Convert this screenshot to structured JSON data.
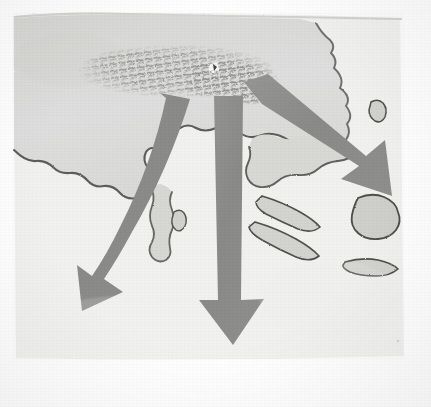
{
  "image": {
    "kind": "scanned-map-figure",
    "medium": "halftone grayscale scan of a printed book page",
    "subject": "Migration / invasion route map of the southern Balkan peninsula and Aegean Sea",
    "orientation": "north-up",
    "visible_text": [],
    "title": "",
    "caption": "",
    "legend": ""
  },
  "colors": {
    "paper": "#fbfbf9",
    "sea": "#f1f1ef",
    "land_fill": "#dcdcda",
    "land_fill_dark": "#cfcfcc",
    "coastline_stroke": "#4c4c4a",
    "coastline_soft": "#9a9a96",
    "arrow_fill": "#8b8b89",
    "arrow_fill_light": "#9b9b99",
    "mountain_texture": "#8e8e8a",
    "scan_edge": "#e6e6e3",
    "marker_white": "#fdfdfb"
  },
  "geography": {
    "landmass_main": {
      "name": "northern-mainland",
      "description": "Large light-grey landmass occupying the top-left two thirds of the frame, with a ragged southern coastline"
    },
    "landmass_east": {
      "name": "eastern-mainland",
      "description": "Land lobe on the upper right, with a deeply indented coastline and a small bay"
    },
    "peninsula": {
      "name": "southern-peninsula",
      "description": "Narrow forked peninsula projecting south from the mainland near the centre"
    },
    "gulf": {
      "name": "central-gulf",
      "description": "Wide white inlet cutting north into the mainland between the peninsulas"
    },
    "islands": [
      {
        "name": "island-north-small",
        "shape": "tiny-blob"
      },
      {
        "name": "island-elongated-upper",
        "shape": "long-sliver"
      },
      {
        "name": "island-elongated-lower",
        "shape": "long-sliver"
      },
      {
        "name": "island-large-east",
        "shape": "rounded-lobed"
      },
      {
        "name": "island-south-small",
        "shape": "flat-sliver"
      },
      {
        "name": "island-offshore-speck",
        "shape": "dot"
      }
    ]
  },
  "mountain_region": {
    "name": "highland-belt",
    "description": "Dense stippled / hachured band of small dark marks running east-west across the upper mainland, representing a mountain range or highland source region",
    "texture": "irregular short dashes and blobs"
  },
  "site_marker": {
    "name": "settlement-marker",
    "description": "Small white highlight spot inside the highland belt, slightly right of centre",
    "label": ""
  },
  "arrows": [
    {
      "id": "arrow-southwest",
      "name": "migration-arrow-southwest",
      "direction": "south-west",
      "heading_degrees": 205,
      "description": "Broad curving arrow sweeping from the highland belt down and to the left, terminating with a large arrowhead in the lower-left sea",
      "tail": {
        "x": 176,
        "y": 96
      },
      "head": {
        "x": 82,
        "y": 311
      }
    },
    {
      "id": "arrow-south",
      "name": "migration-arrow-south",
      "direction": "south",
      "heading_degrees": 180,
      "description": "Wide straight arrow descending from the highland belt through the gulf to the bottom centre of the frame",
      "tail": {
        "x": 229,
        "y": 100
      },
      "head": {
        "x": 233,
        "y": 345
      }
    },
    {
      "id": "arrow-southeast",
      "name": "migration-arrow-southeast",
      "direction": "south-east",
      "heading_degrees": 133,
      "description": "Arrow angling from the highland belt toward the lower right, crossing the eastern coast and ending over the sea near the islands",
      "tail": {
        "x": 252,
        "y": 92
      },
      "head": {
        "x": 392,
        "y": 196
      }
    }
  ],
  "scan_artifacts": {
    "page_edge_top": "slightly ragged dark scan edge along the top of the image block",
    "page_margin_right": "clean white paper margin on the far right",
    "page_margin_bottom": "clean white paper margin along the bottom",
    "grain": "visible halftone / paper grain throughout"
  }
}
